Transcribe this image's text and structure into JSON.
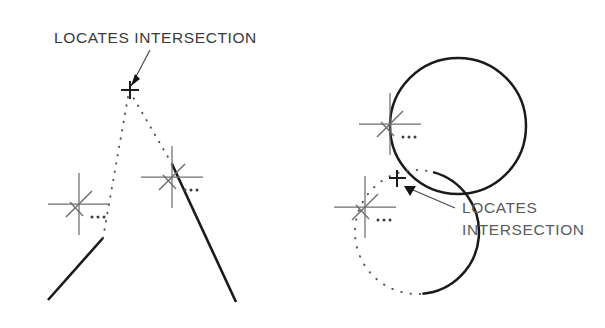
{
  "figure": {
    "background_color": "#ffffff",
    "ink_color": "#1a1a1a",
    "annotation_color": "#3a3a3a",
    "snap_marker_color": "#6e6e72",
    "dotted_extension_color": "#55555a"
  },
  "left_panel": {
    "name": "two-lines-intersection-example",
    "annotation": {
      "text": "LOCATES  INTERSECTION",
      "line1": "LOCATES",
      "line2": "INTERSECTION",
      "x": 54,
      "y": 43
    },
    "leader": {
      "from_x": 150,
      "from_y": 50,
      "to_x": 131,
      "to_y": 86
    },
    "apex_marker": {
      "label": "intersection-point",
      "x": 130,
      "y": 90,
      "size": 9
    },
    "lines": [
      {
        "label": "line-left",
        "x1": 48,
        "y1": 300,
        "x2": 103,
        "y2": 238
      },
      {
        "label": "line-right",
        "x1": 236,
        "y1": 302,
        "x2": 172,
        "y2": 164
      }
    ],
    "dotted_extensions": [
      {
        "label": "extension-left",
        "x1": 103,
        "y1": 238,
        "x2": 128,
        "y2": 96
      },
      {
        "label": "extension-right",
        "x1": 172,
        "y1": 164,
        "x2": 133,
        "y2": 96
      }
    ],
    "snap_markers": [
      {
        "label": "snap-marker-line-left",
        "cx": 79,
        "cy": 204,
        "arm": 31,
        "dots": 3
      },
      {
        "label": "snap-marker-line-right",
        "cx": 172,
        "cy": 177,
        "arm": 31,
        "dots": 3
      }
    ]
  },
  "right_panel": {
    "name": "circle-arc-intersection-example",
    "annotation": {
      "line1": "LOCATES",
      "line2": "INTERSECTION",
      "x": 462,
      "y": 213,
      "line_height": 22
    },
    "leader": {
      "from_x": 455,
      "from_y": 208,
      "to_x": 406,
      "to_y": 187
    },
    "circle": {
      "label": "solid-circle",
      "cx": 458,
      "cy": 126,
      "r": 68
    },
    "arc": {
      "label": "solid-arc",
      "cx": 417,
      "cy": 232,
      "r": 62,
      "start_angle_deg": 285,
      "end_angle_deg": 85,
      "sweep": "counterclockwise"
    },
    "dotted_circle": {
      "label": "arc-dotted-completion",
      "cx": 417,
      "cy": 232,
      "r": 62
    },
    "intersection_marker": {
      "label": "intersection-point",
      "x": 397,
      "y": 178,
      "size": 9
    },
    "snap_markers": [
      {
        "label": "snap-marker-circle",
        "cx": 390,
        "cy": 124,
        "arm": 31,
        "dots": 3
      },
      {
        "label": "snap-marker-arc",
        "cx": 365,
        "cy": 207,
        "arm": 31,
        "dots": 3
      }
    ]
  }
}
